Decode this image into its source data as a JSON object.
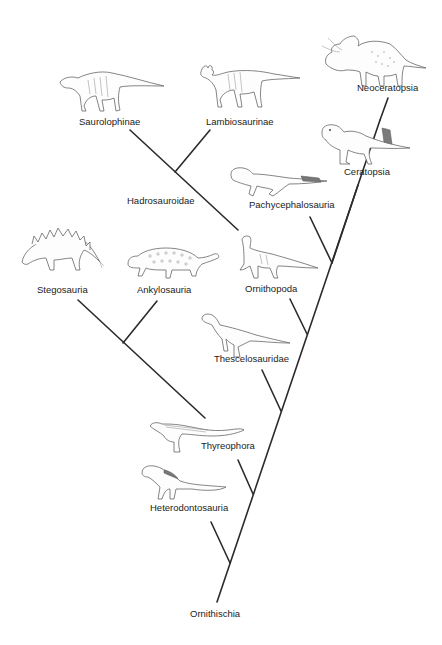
{
  "diagram": {
    "type": "cladogram",
    "root": "Ornithischia",
    "line_color": "#2b2b2b",
    "text_color": "#222222",
    "background": "#ffffff"
  },
  "labels": {
    "saurolophinae": "Saurolophinae",
    "lambiosaurinae": "Lambiosaurinae",
    "hadrosauroidae": "Hadrosauroidae",
    "neoceratopsia": "Neoceratopsia",
    "ceratopsia": "Ceratopsia",
    "pachycephalosauria": "Pachycephalosauria",
    "stegosauria": "Stegosauria",
    "ankylosauria": "Ankylosauria",
    "ornithopoda": "Ornithopoda",
    "thescelosauridae": "Thescelosauridae",
    "thyreophora": "Thyreophora",
    "heterodontosauria": "Heterodontosauria",
    "ornithischia": "Ornithischia"
  },
  "tree": {
    "Ornithischia": [
      "Heterodontosauria",
      "Genasauria"
    ],
    "Genasauria": [
      "Thyreophora",
      "Neornithischia"
    ],
    "Thyreophora": [
      "Stegosauria",
      "Ankylosauria"
    ],
    "Neornithischia": [
      "Thescelosauridae",
      "Cerapoda"
    ],
    "Cerapoda": [
      "Ornithopoda",
      "Marginocephalia"
    ],
    "Ornithopoda": [
      "Hadrosauroidae"
    ],
    "Hadrosauroidae": [
      "Saurolophinae",
      "Lambiosaurinae"
    ],
    "Marginocephalia": [
      "Pachycephalosauria",
      "Ceratopsia"
    ],
    "Ceratopsia": [
      "Neoceratopsia"
    ]
  },
  "illustrations": [
    {
      "clade": "Saurolophinae",
      "icon": "hadrosaur-illustration"
    },
    {
      "clade": "Lambiosaurinae",
      "icon": "crested-hadrosaur-illustration"
    },
    {
      "clade": "Neoceratopsia",
      "icon": "triceratops-illustration"
    },
    {
      "clade": "Ceratopsia",
      "icon": "psittacosaurus-illustration"
    },
    {
      "clade": "Pachycephalosauria",
      "icon": "pachycephalosaur-illustration"
    },
    {
      "clade": "Stegosauria",
      "icon": "stegosaur-illustration"
    },
    {
      "clade": "Ankylosauria",
      "icon": "ankylosaur-illustration"
    },
    {
      "clade": "Ornithopoda",
      "icon": "iguanodont-illustration"
    },
    {
      "clade": "Thescelosauridae",
      "icon": "thescelosaur-illustration"
    },
    {
      "clade": "Thyreophora",
      "icon": "scelidosaur-illustration"
    },
    {
      "clade": "Heterodontosauria",
      "icon": "heterodontosaur-illustration"
    }
  ]
}
